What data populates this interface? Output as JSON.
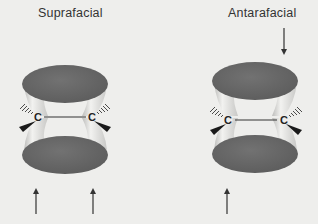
{
  "diagram": {
    "panels": [
      {
        "title": "Suprafacial",
        "atoms": [
          "C",
          "C"
        ],
        "approach": "both-from-bottom-face"
      },
      {
        "title": "Antarafacial",
        "atoms": [
          "C",
          "C"
        ],
        "approach": "one-from-top-one-from-bottom"
      }
    ],
    "colors": {
      "background": "#eeeeec",
      "lobe": "#6b6b6b",
      "lobe_side": "#d4d4d2",
      "text": "#333333",
      "arrow": "#333333"
    }
  }
}
